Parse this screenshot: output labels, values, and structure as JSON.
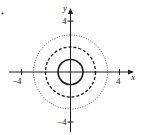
{
  "figure": {
    "bullet": "•",
    "axes": {
      "x_label": "x",
      "y_label": "y",
      "x_ticks": [
        {
          "value": -4,
          "label": "−4"
        },
        {
          "value": 4,
          "label": "4"
        }
      ],
      "y_ticks": [
        {
          "value": 4,
          "label": "4"
        },
        {
          "value": -4,
          "label": "−4"
        }
      ]
    },
    "circles": [
      {
        "radius": 1,
        "style": "solid"
      },
      {
        "radius": 2,
        "style": "dashed"
      },
      {
        "radius": 3,
        "style": "dotted"
      }
    ],
    "colors": {
      "stroke": "#1a1a1a",
      "background": "#ffffff"
    }
  }
}
